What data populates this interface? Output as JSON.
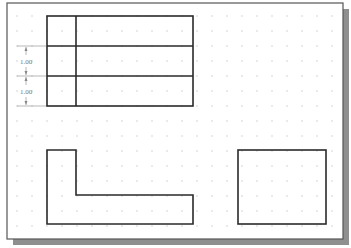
{
  "canvas": {
    "frame": {
      "x": 7,
      "y": 3,
      "w": 336,
      "h": 236
    },
    "shadow_offset": 6,
    "colors": {
      "background": "#ffffff",
      "frame_border": "#555555",
      "shadow": "#8f8f8f",
      "shape_stroke": "#2a2a2a",
      "grid_dot": "#c4c4c4",
      "dimension_line": "#888888",
      "dimension_text": "#777777"
    },
    "grid": {
      "spacing": 15,
      "origin_x": 17,
      "origin_y": 16
    }
  },
  "shapes": {
    "table": {
      "x": 47,
      "y": 16,
      "w": 146,
      "h": 90,
      "column_divider_x": 76,
      "row_lines_y": [
        46,
        76
      ]
    },
    "l_shape": {
      "points": "47,150 76,150 76,195 193,195 193,224 47,224"
    },
    "rectangle": {
      "x": 238,
      "y": 150,
      "w": 88,
      "h": 74
    }
  },
  "dimensions": [
    {
      "label": "1.00",
      "y1": 46,
      "y2": 76
    },
    {
      "label": "1.00",
      "y1": 76,
      "y2": 106
    }
  ]
}
